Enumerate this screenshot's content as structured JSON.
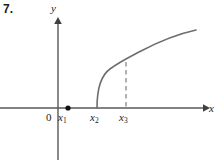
{
  "figure": {
    "problem_number": "7.",
    "axes": {
      "x_label": "x",
      "y_label": "y",
      "origin_label": "0",
      "x_axis_y_px": 108,
      "y_axis_x_px": 58,
      "x_axis_from_px": 0,
      "x_axis_to_px": 207,
      "y_axis_from_px": 160,
      "y_axis_to_px": 18
    },
    "tick_marks": [
      {
        "name": "x1",
        "label": "x",
        "subscript": "1",
        "x_px": 68,
        "has_point_marker": true
      },
      {
        "name": "x2",
        "label": "x",
        "subscript": "2",
        "x_px": 97,
        "has_point_marker": false
      },
      {
        "name": "x3",
        "label": "x",
        "subscript": "3",
        "x_px": 126,
        "has_point_marker": false
      }
    ],
    "curve": {
      "description": "increasing concave-down curve with vertical tangent at x2",
      "start_x_px": 97,
      "start_y_px": 108,
      "end_x_px": 196,
      "end_y_px": 30,
      "path": "M 97,108 C 97,92 100,76 110,69 C 121,61 128,58 141,51 C 158,42 178,34 196,30"
    },
    "dashed_line": {
      "description": "vertical dashed segment from x3 on the axis up to the curve",
      "x_px": 126,
      "y_top_px": 62,
      "y_bottom_px": 108
    },
    "point_marker": {
      "description": "filled dot on the x-axis at x1",
      "x_px": 68,
      "y_px": 108,
      "radius_px": 2.6
    },
    "colors": {
      "background": "#ffffff",
      "axis": "#58585a",
      "curve": "#6e6e70",
      "dashed": "#8a8a8c",
      "text": "#1a1a1a",
      "point": "#111111"
    }
  }
}
